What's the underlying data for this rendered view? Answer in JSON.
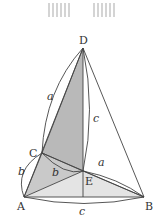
{
  "diagram": {
    "points": {
      "D": {
        "label": "D",
        "x": 83,
        "y": 48
      },
      "C": {
        "label": "C",
        "x": 42,
        "y": 153
      },
      "E": {
        "label": "E",
        "x": 83,
        "y": 171
      },
      "A": {
        "label": "A",
        "x": 24,
        "y": 197
      },
      "B": {
        "label": "B",
        "x": 144,
        "y": 197
      }
    },
    "edge_labels": {
      "a_left": "a",
      "c_right": "c",
      "a_right": "a",
      "b_left": "b",
      "b_inner": "b",
      "c_bottom": "c"
    },
    "colors": {
      "line": "#444444",
      "shade_dark": "#b5b5b5",
      "shade_light": "#e2e2e2",
      "watermark": "#c8c8c8"
    }
  }
}
